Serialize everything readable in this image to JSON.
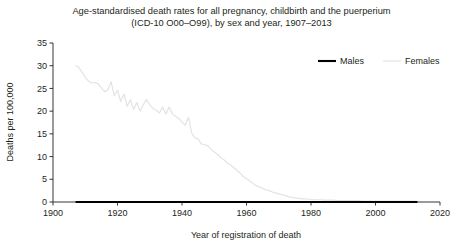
{
  "chart_data": {
    "type": "line",
    "title": "Age-standardised death rates for all pregnancy, childbirth and the puerperium (ICD-10 O00–O99), by sex and year, 1907–2013",
    "title_line1": "Age-standardised death rates for all pregnancy, childbirth and the puerperium",
    "title_line2": "(ICD-10 O00–O99), by sex and year, 1907–2013",
    "xlabel": "Year of registration of death",
    "ylabel": "Deaths per 100,000",
    "xlim": [
      1900,
      2020
    ],
    "ylim": [
      0,
      35
    ],
    "xticks": [
      1900,
      1920,
      1940,
      1960,
      1980,
      2000,
      2020
    ],
    "xtick_labels": [
      "1900",
      "1920",
      "1940",
      "1960",
      "1980",
      "2000",
      "2020"
    ],
    "yticks": [
      0,
      5,
      10,
      15,
      20,
      25,
      30,
      35
    ],
    "ytick_labels": [
      "0",
      "5",
      "10",
      "15",
      "20",
      "25",
      "30",
      "35"
    ],
    "grid": false,
    "legend_position": "top-right",
    "series": [
      {
        "name": "Males",
        "color": "#000000",
        "line_width": 2.1,
        "x": [
          1907,
          1910,
          1915,
          1920,
          1925,
          1930,
          1935,
          1940,
          1945,
          1950,
          1955,
          1960,
          1965,
          1970,
          1975,
          1980,
          1985,
          1990,
          1995,
          2000,
          2005,
          2010,
          2013
        ],
        "values": [
          0,
          0,
          0,
          0,
          0,
          0,
          0,
          0,
          0,
          0,
          0,
          0,
          0,
          0,
          0,
          0,
          0,
          0,
          0,
          0,
          0,
          0,
          0
        ]
      },
      {
        "name": "Females",
        "color": "#e3e3e3",
        "line_width": 1.2,
        "x": [
          1907,
          1908,
          1909,
          1910,
          1911,
          1912,
          1913,
          1914,
          1915,
          1916,
          1917,
          1918,
          1919,
          1920,
          1921,
          1922,
          1923,
          1924,
          1925,
          1926,
          1927,
          1928,
          1929,
          1930,
          1931,
          1932,
          1933,
          1934,
          1935,
          1936,
          1937,
          1938,
          1939,
          1940,
          1941,
          1942,
          1943,
          1944,
          1945,
          1946,
          1947,
          1948,
          1949,
          1950,
          1951,
          1952,
          1953,
          1954,
          1955,
          1956,
          1957,
          1958,
          1959,
          1960,
          1961,
          1962,
          1963,
          1964,
          1965,
          1966,
          1967,
          1968,
          1969,
          1970,
          1971,
          1972,
          1973,
          1974,
          1975,
          1976,
          1977,
          1978,
          1979,
          1980,
          1981,
          1982,
          1983,
          1984,
          1985,
          1986,
          1987,
          1988,
          1989,
          1990,
          1991,
          1992,
          1993,
          1994,
          1995,
          1996,
          1997,
          1998,
          1999,
          2000,
          2001,
          2002,
          2003,
          2004,
          2005,
          2006,
          2007,
          2008,
          2009,
          2010,
          2011,
          2012,
          2013
        ],
        "values": [
          30.1,
          29.6,
          28.6,
          27.4,
          26.6,
          26.2,
          26.3,
          26.0,
          25.1,
          24.3,
          24.7,
          26.5,
          23.4,
          24.6,
          22.1,
          23.8,
          21.1,
          22.5,
          20.4,
          21.9,
          20.0,
          21.4,
          22.6,
          21.4,
          20.6,
          20.2,
          19.6,
          20.9,
          19.4,
          20.9,
          19.4,
          18.9,
          18.4,
          17.6,
          16.9,
          18.6,
          15.2,
          14.1,
          13.9,
          12.8,
          12.6,
          12.4,
          11.6,
          11.0,
          10.5,
          9.8,
          9.3,
          8.6,
          8.2,
          7.6,
          7.0,
          6.4,
          5.6,
          5.1,
          4.6,
          4.1,
          3.6,
          3.3,
          3.0,
          2.7,
          2.5,
          2.2,
          2.0,
          1.8,
          1.6,
          1.4,
          1.2,
          1.0,
          0.9,
          0.8,
          0.7,
          0.7,
          0.6,
          0.6,
          0.5,
          0.5,
          0.5,
          0.4,
          0.4,
          0.4,
          0.4,
          0.3,
          0.3,
          0.3,
          0.3,
          0.3,
          0.3,
          0.3,
          0.3,
          0.2,
          0.2,
          0.2,
          0.2,
          0.2,
          0.2,
          0.2,
          0.2,
          0.2,
          0.2,
          0.2,
          0.2,
          0.2,
          0.2,
          0.2,
          0.2,
          0.2,
          0.2
        ]
      }
    ],
    "legend": [
      {
        "label": "Males",
        "color": "#000000",
        "line_width": 2.1
      },
      {
        "label": "Females",
        "color": "#e3e3e3",
        "line_width": 1.2
      }
    ]
  }
}
